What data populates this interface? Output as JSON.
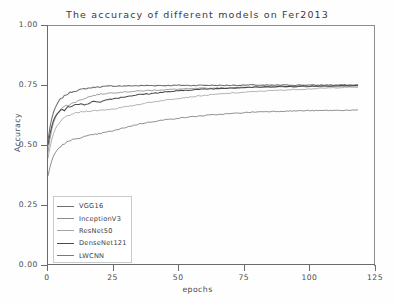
{
  "chart_data": {
    "type": "line",
    "title": "The accuracy of different models on Fer2013",
    "xlabel": "epochs",
    "ylabel": "Accuracy",
    "xlim": [
      0,
      125
    ],
    "ylim": [
      0.0,
      1.0
    ],
    "xticks": [
      "0",
      "25",
      "50",
      "75",
      "100",
      "125"
    ],
    "xtick_values": [
      0,
      25,
      50,
      75,
      100,
      125
    ],
    "yticks": [
      "0.00",
      "0.25",
      "0.50",
      "0.75",
      "1.00"
    ],
    "ytick_values": [
      0.0,
      0.25,
      0.5,
      0.75,
      1.0
    ],
    "grid": false,
    "legend_position": "lower left",
    "x": [
      0,
      1,
      2,
      3,
      4,
      5,
      6,
      7,
      8,
      9,
      10,
      12,
      14,
      16,
      18,
      20,
      23,
      26,
      29,
      32,
      35,
      38,
      42,
      46,
      50,
      54,
      58,
      62,
      66,
      70,
      74,
      78,
      82,
      86,
      90,
      94,
      98,
      102,
      106,
      110,
      114,
      118
    ],
    "series": [
      {
        "name": "VGG16",
        "color": "#6e6e6e",
        "values": [
          0.52,
          0.592,
          0.634,
          0.662,
          0.68,
          0.694,
          0.702,
          0.71,
          0.716,
          0.721,
          0.725,
          0.73,
          0.734,
          0.738,
          0.741,
          0.743,
          0.745,
          0.746,
          0.746,
          0.747,
          0.747,
          0.748,
          0.748,
          0.748,
          0.749,
          0.748,
          0.749,
          0.749,
          0.748,
          0.749,
          0.749,
          0.75,
          0.749,
          0.749,
          0.75,
          0.749,
          0.75,
          0.749,
          0.75,
          0.75,
          0.75,
          0.75
        ]
      },
      {
        "name": "InceptionV3",
        "color": "#8c8c8c",
        "values": [
          0.47,
          0.545,
          0.59,
          0.618,
          0.636,
          0.65,
          0.662,
          0.668,
          0.664,
          0.672,
          0.678,
          0.686,
          0.695,
          0.702,
          0.708,
          0.712,
          0.716,
          0.719,
          0.721,
          0.723,
          0.725,
          0.727,
          0.729,
          0.731,
          0.733,
          0.734,
          0.736,
          0.737,
          0.738,
          0.739,
          0.74,
          0.741,
          0.741,
          0.742,
          0.742,
          0.743,
          0.743,
          0.744,
          0.744,
          0.744,
          0.745,
          0.745
        ]
      },
      {
        "name": "ResNet50",
        "color": "#a3a3a3",
        "values": [
          0.445,
          0.505,
          0.545,
          0.572,
          0.59,
          0.602,
          0.61,
          0.618,
          0.624,
          0.628,
          0.632,
          0.636,
          0.64,
          0.642,
          0.643,
          0.645,
          0.648,
          0.652,
          0.658,
          0.664,
          0.67,
          0.676,
          0.683,
          0.689,
          0.695,
          0.7,
          0.705,
          0.709,
          0.713,
          0.716,
          0.719,
          0.722,
          0.725,
          0.727,
          0.729,
          0.731,
          0.733,
          0.735,
          0.737,
          0.739,
          0.74,
          0.741
        ]
      },
      {
        "name": "DenseNet121",
        "color": "#4a4a4a",
        "values": [
          0.5,
          0.56,
          0.6,
          0.624,
          0.638,
          0.648,
          0.642,
          0.654,
          0.662,
          0.658,
          0.666,
          0.672,
          0.668,
          0.676,
          0.682,
          0.68,
          0.69,
          0.695,
          0.7,
          0.706,
          0.71,
          0.713,
          0.718,
          0.722,
          0.726,
          0.729,
          0.732,
          0.734,
          0.736,
          0.738,
          0.739,
          0.741,
          0.742,
          0.743,
          0.744,
          0.744,
          0.745,
          0.746,
          0.746,
          0.747,
          0.747,
          0.748
        ]
      },
      {
        "name": "LWCNN",
        "color": "#7a7a7a",
        "values": [
          0.372,
          0.42,
          0.452,
          0.472,
          0.486,
          0.496,
          0.504,
          0.51,
          0.516,
          0.52,
          0.524,
          0.53,
          0.535,
          0.54,
          0.544,
          0.548,
          0.555,
          0.562,
          0.572,
          0.58,
          0.588,
          0.594,
          0.601,
          0.607,
          0.612,
          0.617,
          0.621,
          0.625,
          0.628,
          0.631,
          0.634,
          0.637,
          0.639,
          0.64,
          0.641,
          0.642,
          0.643,
          0.643,
          0.644,
          0.644,
          0.645,
          0.645
        ]
      }
    ]
  }
}
